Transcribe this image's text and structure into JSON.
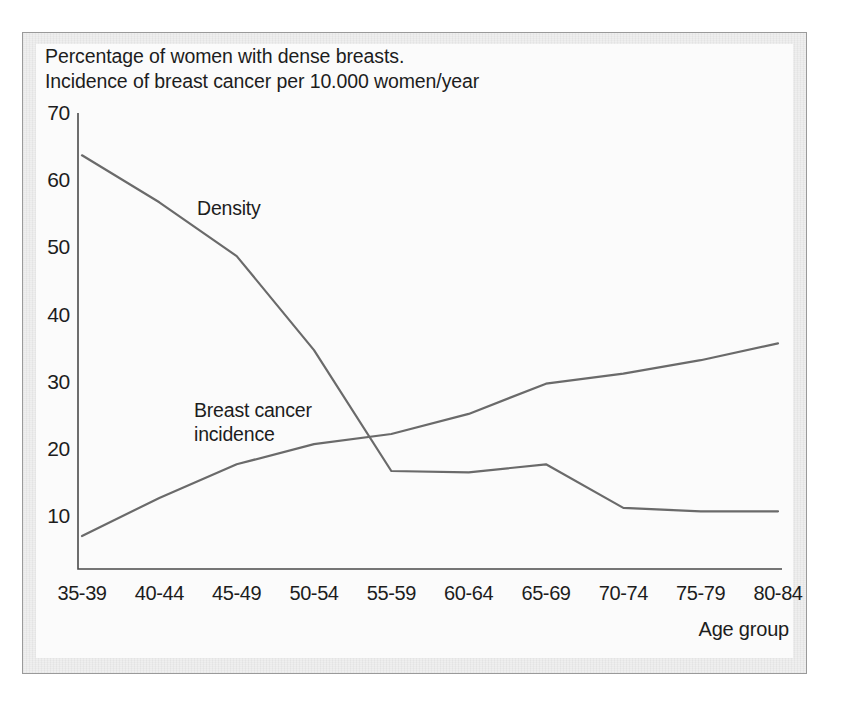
{
  "figure": {
    "caption": "Percentage of women with dense breasts.\nIncidence of breast cancer per 10.000 women/year",
    "line_color": "#6a6a6a",
    "axis_color": "#4a4a4a",
    "text_color": "#1d1d1d",
    "frame_color": "#9a9a9a"
  },
  "chart_data": {
    "type": "line",
    "title": "Percentage of women with dense breasts. Incidence of breast cancer per 10.000 women/year",
    "xlabel": "Age group",
    "ylabel": "",
    "categories": [
      "35-39",
      "40-44",
      "45-49",
      "50-54",
      "55-59",
      "60-64",
      "65-69",
      "70-74",
      "75-79",
      "80-84"
    ],
    "yticks": [
      10,
      20,
      30,
      40,
      50,
      60,
      70
    ],
    "ylim": [
      0,
      70
    ],
    "grid": false,
    "legend": "inline-annotations",
    "series": [
      {
        "name": "Density",
        "label": "Density",
        "color": "#6a6a6a",
        "values": [
          64,
          57,
          49,
          35,
          17,
          16.8,
          18,
          11.5,
          11,
          11
        ]
      },
      {
        "name": "Breast cancer incidence",
        "label": "Breast cancer\nincidence",
        "color": "#6a6a6a",
        "values": [
          7.3,
          13,
          18,
          21,
          22.5,
          25.5,
          30,
          31.5,
          33.5,
          36
        ]
      }
    ]
  }
}
